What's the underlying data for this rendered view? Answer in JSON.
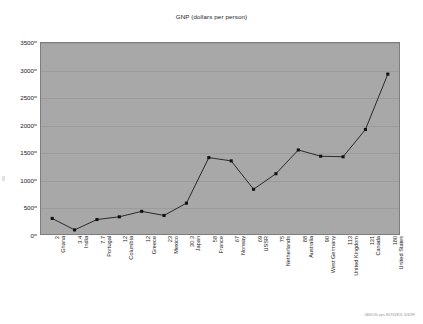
{
  "chart_data": {
    "type": "line",
    "title": "GNP (dollars per person)",
    "xlabel": "",
    "ylabel": "",
    "ylim": [
      0,
      3500
    ],
    "yticks": [
      0,
      500,
      1000,
      1500,
      2000,
      2500,
      3000,
      3500
    ],
    "grid": true,
    "legend": null,
    "categories": [
      "Ghana",
      "India",
      "Portugal",
      "Columbia",
      "Greece",
      "Mexico",
      "Japan",
      "France",
      "Norway",
      "USSR",
      "Netherlands",
      "Australia",
      "West Germany",
      "United Kingdom",
      "Canada",
      "United States"
    ],
    "category_numbers": [
      "3",
      "3.4",
      "7.7",
      "12",
      "12",
      "23",
      "30.3",
      "58",
      "67",
      "69",
      "75",
      "88",
      "90",
      "113",
      "131",
      "180"
    ],
    "values": [
      285,
      75,
      265,
      315,
      415,
      340,
      565,
      1400,
      1340,
      820,
      1105,
      1540,
      1425,
      1415,
      1915,
      2930
    ],
    "series_name": "GNP (dollars per person)",
    "marker": "square",
    "line_color": "#1a1a1a",
    "marker_color": "#111111",
    "plot_background": "#a8a8a8",
    "figure_background": "#ffffff"
  },
  "footer": {
    "id_text": "080/t20.sps 80762811 4/6/99"
  }
}
